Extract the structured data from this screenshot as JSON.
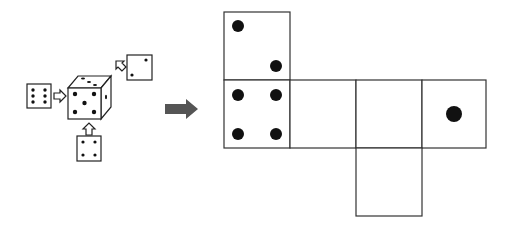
{
  "diagram": {
    "cube": {
      "front_face_pips": 5,
      "top_face_pips": 3,
      "right_face_pips": 1,
      "views": [
        {
          "direction": "left",
          "pips": 6
        },
        {
          "direction": "top-right",
          "pips": 2
        },
        {
          "direction": "bottom",
          "pips": 4
        }
      ]
    },
    "arrow": {
      "color": "#555555",
      "meaning": "unfold"
    },
    "net": {
      "faces": [
        {
          "position": "top",
          "pips": 2
        },
        {
          "position": "row-1",
          "pips": 4
        },
        {
          "position": "row-2",
          "pips": 0
        },
        {
          "position": "row-3",
          "pips": 0
        },
        {
          "position": "row-4",
          "pips": 1
        },
        {
          "position": "bottom",
          "pips": 0
        }
      ]
    }
  }
}
